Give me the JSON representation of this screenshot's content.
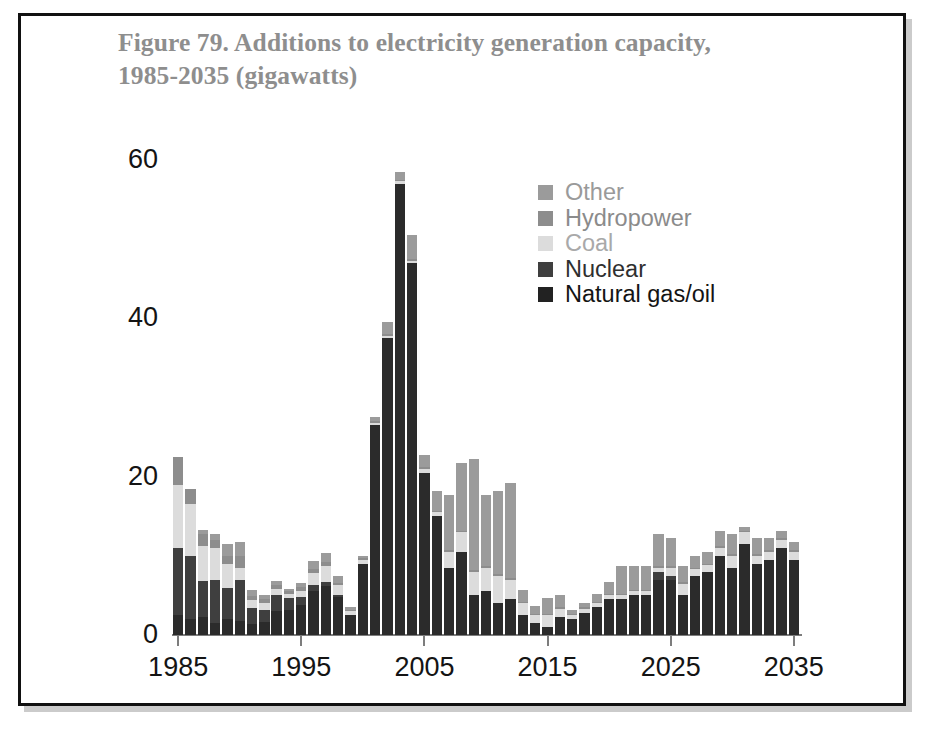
{
  "figure": {
    "title_line1": "Figure 79. Additions to electricity generation capacity,",
    "title_line2": "1985-2035 (gigawatts)"
  },
  "legend": {
    "position": "inside-top-right",
    "items": [
      {
        "label": "Other",
        "color": "#9b9b9b",
        "key": "other"
      },
      {
        "label": "Hydropower",
        "color": "#8d8d8d",
        "key": "hydropower"
      },
      {
        "label": "Coal",
        "color": "#dcdcdc",
        "key": "coal"
      },
      {
        "label": "Nuclear",
        "color": "#3f3f3f",
        "key": "nuclear"
      },
      {
        "label": "Natural gas/oil",
        "color": "#222222",
        "key": "natural_gas_oil"
      }
    ]
  },
  "axes": {
    "y_ticks": [
      "0",
      "20",
      "40",
      "60"
    ],
    "y_tick_values": [
      0,
      20,
      40,
      60
    ],
    "x_ticks": [
      "1985",
      "1995",
      "2005",
      "2015",
      "2025",
      "2035"
    ],
    "x_tick_values": [
      1985,
      1995,
      2005,
      2015,
      2025,
      2035
    ]
  },
  "chart_data": {
    "type": "bar",
    "stacked": true,
    "title": "Figure 79. Additions to electricity generation capacity, 1985-2035 (gigawatts)",
    "xlabel": "",
    "ylabel": "",
    "unit": "gigawatts",
    "ylim": [
      0,
      60
    ],
    "xlim": [
      1985,
      2035
    ],
    "grid": false,
    "legend_position": "inside-top-right",
    "categories": [
      1985,
      1986,
      1987,
      1988,
      1989,
      1990,
      1991,
      1992,
      1993,
      1994,
      1995,
      1996,
      1997,
      1998,
      1999,
      2000,
      2001,
      2002,
      2003,
      2004,
      2005,
      2006,
      2007,
      2008,
      2009,
      2010,
      2011,
      2012,
      2013,
      2014,
      2015,
      2016,
      2017,
      2018,
      2019,
      2020,
      2021,
      2022,
      2023,
      2024,
      2025,
      2026,
      2027,
      2028,
      2029,
      2030,
      2031,
      2032,
      2033,
      2034,
      2035
    ],
    "series": [
      {
        "name": "Natural gas/oil",
        "color": "#2b2b2b",
        "values": [
          2.5,
          2.0,
          2.3,
          1.5,
          2.0,
          1.8,
          1.4,
          1.6,
          3.0,
          3.2,
          3.8,
          5.5,
          6.2,
          4.8,
          2.5,
          9.0,
          26.5,
          37.5,
          57.0,
          47.0,
          20.5,
          15.0,
          8.5,
          10.5,
          5.0,
          5.5,
          4.0,
          4.5,
          2.5,
          1.5,
          1.0,
          2.3,
          2.0,
          2.8,
          3.5,
          4.5,
          4.5,
          5.0,
          5.0,
          7.0,
          7.0,
          5.0,
          7.5,
          8.0,
          10.0,
          8.5,
          11.5,
          9.0,
          9.5,
          11.0,
          9.5
        ]
      },
      {
        "name": "Nuclear",
        "color": "#3f3f3f",
        "values": [
          8.5,
          8.0,
          4.5,
          5.5,
          4.0,
          5.2,
          2.0,
          1.5,
          2.0,
          1.5,
          1.0,
          0.8,
          0.5,
          0.3,
          0.0,
          0.0,
          0.0,
          0.0,
          0.0,
          0.0,
          0.0,
          0.0,
          0.0,
          0.0,
          0.0,
          0.0,
          0.0,
          0.0,
          0.0,
          0.0,
          0.0,
          0.0,
          0.0,
          0.0,
          0.0,
          0.0,
          0.0,
          0.0,
          0.0,
          1.0,
          0.5,
          0.0,
          0.0,
          0.0,
          0.0,
          0.0,
          0.0,
          0.0,
          0.0,
          0.0,
          0.0
        ]
      },
      {
        "name": "Coal",
        "color": "#dcdcdc",
        "values": [
          8.0,
          6.5,
          4.5,
          4.0,
          3.0,
          1.5,
          1.0,
          1.0,
          0.8,
          0.5,
          0.8,
          1.5,
          2.0,
          1.2,
          0.5,
          0.5,
          0.3,
          0.3,
          0.3,
          0.3,
          0.5,
          0.5,
          2.0,
          2.5,
          3.0,
          3.0,
          3.5,
          2.5,
          1.5,
          1.0,
          1.5,
          1.0,
          0.5,
          0.5,
          0.5,
          0.5,
          0.5,
          0.5,
          0.5,
          0.5,
          1.0,
          1.5,
          0.8,
          0.8,
          1.0,
          1.5,
          1.5,
          1.0,
          1.0,
          1.0,
          1.0
        ]
      },
      {
        "name": "Hydropower",
        "color": "#8d8d8d",
        "values": [
          3.5,
          2.0,
          1.5,
          1.0,
          1.0,
          1.5,
          0.5,
          0.5,
          0.5,
          0.3,
          0.5,
          0.5,
          0.5,
          0.3,
          0.2,
          0.2,
          0.2,
          0.2,
          0.2,
          0.2,
          0.2,
          0.2,
          0.2,
          0.2,
          0.2,
          0.2,
          0.2,
          0.2,
          0.2,
          0.2,
          0.2,
          0.2,
          0.2,
          0.2,
          0.2,
          0.2,
          0.2,
          0.2,
          0.2,
          0.2,
          0.2,
          0.2,
          0.2,
          0.2,
          0.2,
          0.2,
          0.2,
          0.2,
          0.2,
          0.2,
          0.2
        ]
      },
      {
        "name": "Other",
        "color": "#9b9b9b",
        "values": [
          0.0,
          0.0,
          0.5,
          0.8,
          1.5,
          1.8,
          0.8,
          0.5,
          0.5,
          0.3,
          0.5,
          1.0,
          1.2,
          0.8,
          0.3,
          0.3,
          0.5,
          1.5,
          1.0,
          3.0,
          1.5,
          2.5,
          7.0,
          8.5,
          14.0,
          9.0,
          10.5,
          12.0,
          1.5,
          1.0,
          2.0,
          1.5,
          0.5,
          0.5,
          1.0,
          1.5,
          3.5,
          3.0,
          3.0,
          4.0,
          3.5,
          2.0,
          1.5,
          1.5,
          2.0,
          2.5,
          0.5,
          2.0,
          1.5,
          1.0,
          1.0
        ]
      }
    ],
    "totals": [
      22.5,
      18.5,
      13.3,
      12.8,
      11.5,
      11.8,
      5.7,
      5.1,
      6.8,
      5.8,
      6.6,
      9.3,
      10.4,
      7.4,
      3.5,
      10.0,
      27.5,
      39.5,
      58.5,
      50.5,
      22.7,
      18.2,
      17.7,
      21.7,
      22.2,
      17.7,
      18.2,
      19.2,
      5.7,
      3.7,
      4.7,
      5.0,
      3.2,
      4.0,
      5.2,
      6.7,
      8.7,
      8.7,
      8.7,
      12.7,
      12.2,
      8.7,
      10.0,
      10.5,
      13.2,
      12.7,
      13.7,
      12.2,
      12.2,
      13.2,
      11.7
    ]
  }
}
